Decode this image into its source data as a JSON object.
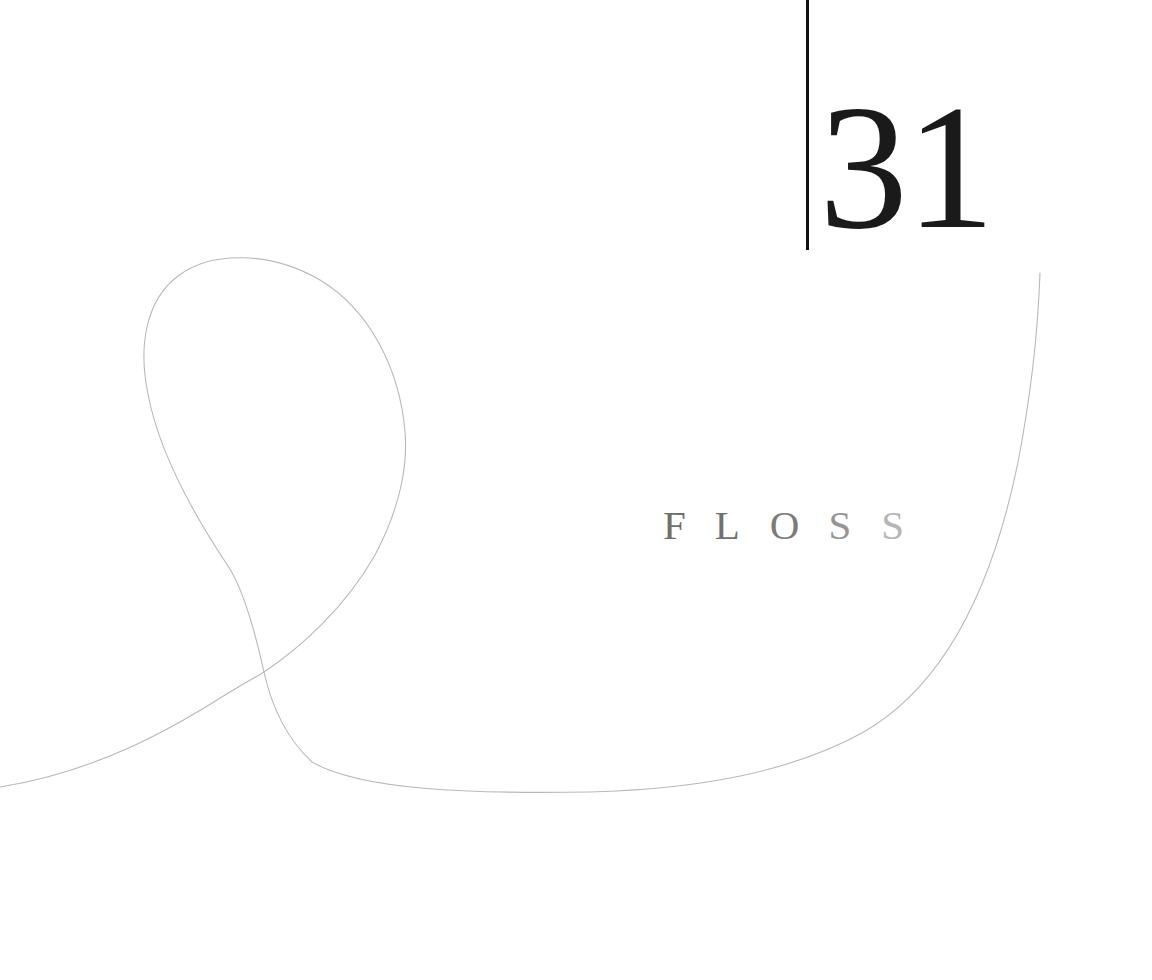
{
  "page": {
    "background_color": "#ffffff",
    "width": 1152,
    "height": 980
  },
  "folio": {
    "number": "31",
    "rule_color": "#111111",
    "number_color": "#1a1a1a"
  },
  "wordmark": {
    "text": "FLOSS",
    "letters": [
      {
        "char": "F",
        "color": "#6f6f6f",
        "spacing_after": 29
      },
      {
        "char": "L",
        "color": "#717171",
        "spacing_after": 30
      },
      {
        "char": "O",
        "color": "#7b7b7b",
        "spacing_after": 29
      },
      {
        "char": "S",
        "color": "#969696",
        "spacing_after": 30
      },
      {
        "char": "S",
        "color": "#b6b6b6",
        "spacing_after": 0
      }
    ]
  },
  "ribbon": {
    "stroke_color": "#b9b9bd",
    "stroke_width": 1.1,
    "description": "single continuous hairline ribbon forming a teardrop loop at left that crosses itself and sweeps right and upward",
    "path": "M 0 787 C 95 772 170 730 225 695 C 248 681 256 677 264 672 C 300 648 345 608 375 555 C 400 508 408 465 405 432 C 400 370 370 310 320 280 C 272 252 212 250 178 276 C 146 300 138 346 148 394 C 158 448 188 506 228 566 C 240 584 252 618 264 672 C 272 708 286 738 312 762 C 360 790 470 794 590 792 C 700 789 790 772 862 733 C 938 690 990 600 1018 462 C 1030 400 1038 330 1040 273"
  }
}
